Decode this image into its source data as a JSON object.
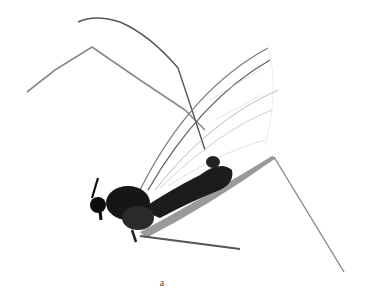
{
  "figure": {
    "caption": "a",
    "background_color": "#ffffff",
    "body_color": "#1a1a1a",
    "leg_color": "#777777",
    "wing_vein_color": "#999999"
  }
}
